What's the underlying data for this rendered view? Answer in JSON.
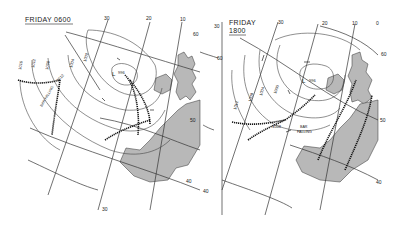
{
  "panels": [
    {
      "title_day": "FRIDAY",
      "title_time": "0600",
      "title_full": "FRIDAY 0600",
      "longitude_labels": [
        "30",
        "20",
        "10",
        "30"
      ],
      "latitude_labels": [
        "60",
        "50",
        "40"
      ],
      "isobar_labels": [
        "1016",
        "1012",
        "1008",
        "1012",
        "1004",
        "1000",
        "1004"
      ],
      "low_center": {
        "label": "L",
        "pressure": "996"
      },
      "annotation": "BAR FALLING"
    },
    {
      "title_day": "FRIDAY",
      "title_time": "1800",
      "title_full": "FRIDAY 1800",
      "longitude_labels": [
        "30",
        "20",
        "10",
        "0",
        "30"
      ],
      "latitude_labels": [
        "60",
        "50",
        "40"
      ],
      "isobar_labels": [
        "1012",
        "1008",
        "1004",
        "1000",
        "1008"
      ],
      "low_center": {
        "label": "L",
        "pressure": "996"
      },
      "annotation": "BAR FALLING"
    }
  ],
  "colors": {
    "land": "#b8b8b8",
    "lines": "#333333",
    "background": "#ffffff"
  }
}
